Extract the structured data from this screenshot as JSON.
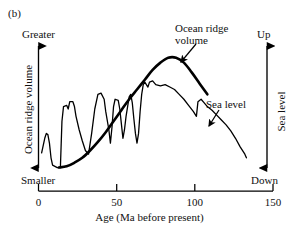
{
  "figure": {
    "panel_label": "(b)",
    "left_axis": {
      "title": "Ocean ridge volume",
      "top_label": "Greater",
      "bottom_label": "Smaller"
    },
    "right_axis": {
      "title": "Sea level",
      "top_label": "Up",
      "bottom_label": "Down"
    },
    "x_axis": {
      "title": "Age (Ma before present)",
      "ticks": [
        "0",
        "50",
        "100",
        "150"
      ]
    },
    "annotations": {
      "ocean_ridge": "Ocean ridge volume",
      "sea_level": "Sea level"
    }
  },
  "chart_data": {
    "type": "line",
    "title": "",
    "subtitle": "",
    "panel": "(b)",
    "xlabel": "Age (Ma before present)",
    "ylabel": "Ocean ridge volume",
    "ylabel_right": "Sea level",
    "xlim": [
      0,
      150
    ],
    "xticks": [
      0,
      50,
      100,
      150
    ],
    "ylim_left": [
      "Smaller",
      "Greater"
    ],
    "ylim_right": [
      "Down",
      "Up"
    ],
    "grid": false,
    "legend": "inline-annotations",
    "axis_style": "double-headed-arrows",
    "series": [
      {
        "name": "Ocean ridge volume",
        "axis": "left",
        "annotation": "Ocean ridge volume",
        "smooth": true,
        "points": [
          [
            13,
            0.02
          ],
          [
            18,
            0.03
          ],
          [
            23,
            0.06
          ],
          [
            28,
            0.1
          ],
          [
            33,
            0.16
          ],
          [
            38,
            0.23
          ],
          [
            43,
            0.31
          ],
          [
            48,
            0.4
          ],
          [
            53,
            0.49
          ],
          [
            58,
            0.58
          ],
          [
            63,
            0.66
          ],
          [
            68,
            0.74
          ],
          [
            73,
            0.82
          ],
          [
            78,
            0.88
          ],
          [
            83,
            0.92
          ],
          [
            88,
            0.92
          ],
          [
            93,
            0.88
          ],
          [
            98,
            0.8
          ],
          [
            103,
            0.71
          ],
          [
            108,
            0.62
          ]
        ]
      },
      {
        "name": "Sea level",
        "axis": "right",
        "annotation": "Sea level",
        "smooth": false,
        "points": [
          [
            2,
            0.14
          ],
          [
            4,
            0.26
          ],
          [
            5,
            0.3
          ],
          [
            6,
            0.29
          ],
          [
            7,
            0.22
          ],
          [
            8,
            0.1
          ],
          [
            9,
            0.04
          ],
          [
            12,
            0.02
          ],
          [
            14,
            0.02
          ],
          [
            15,
            0.4
          ],
          [
            16,
            0.52
          ],
          [
            18,
            0.53
          ],
          [
            19,
            0.5
          ],
          [
            20,
            0.56
          ],
          [
            22,
            0.56
          ],
          [
            23,
            0.52
          ],
          [
            24,
            0.44
          ],
          [
            26,
            0.33
          ],
          [
            28,
            0.24
          ],
          [
            30,
            0.16
          ],
          [
            32,
            0.13
          ],
          [
            34,
            0.3
          ],
          [
            36,
            0.5
          ],
          [
            38,
            0.62
          ],
          [
            40,
            0.63
          ],
          [
            42,
            0.58
          ],
          [
            43,
            0.48
          ],
          [
            45,
            0.33
          ],
          [
            46,
            0.22
          ],
          [
            47,
            0.35
          ],
          [
            48,
            0.52
          ],
          [
            49,
            0.58
          ],
          [
            51,
            0.57
          ],
          [
            52,
            0.5
          ],
          [
            53,
            0.38
          ],
          [
            54,
            0.26
          ],
          [
            55,
            0.33
          ],
          [
            56,
            0.44
          ],
          [
            57,
            0.52
          ],
          [
            58,
            0.6
          ],
          [
            59,
            0.62
          ],
          [
            60,
            0.55
          ],
          [
            61,
            0.42
          ],
          [
            62,
            0.3
          ],
          [
            63,
            0.22
          ],
          [
            64,
            0.3
          ],
          [
            65,
            0.48
          ],
          [
            66,
            0.62
          ],
          [
            67,
            0.7
          ],
          [
            68,
            0.72
          ],
          [
            70,
            0.68
          ],
          [
            71,
            0.72
          ],
          [
            73,
            0.73
          ],
          [
            75,
            0.7
          ],
          [
            78,
            0.69
          ],
          [
            81,
            0.7
          ],
          [
            84,
            0.68
          ],
          [
            87,
            0.66
          ],
          [
            90,
            0.62
          ],
          [
            93,
            0.58
          ],
          [
            96,
            0.53
          ],
          [
            99,
            0.48
          ],
          [
            101,
            0.44
          ],
          [
            102,
            0.56
          ],
          [
            104,
            0.58
          ],
          [
            106,
            0.55
          ],
          [
            108,
            0.52
          ],
          [
            111,
            0.49
          ],
          [
            114,
            0.45
          ],
          [
            117,
            0.41
          ],
          [
            120,
            0.37
          ],
          [
            123,
            0.32
          ],
          [
            126,
            0.26
          ],
          [
            129,
            0.19
          ],
          [
            132,
            0.13
          ],
          [
            133,
            0.1
          ]
        ]
      }
    ]
  }
}
